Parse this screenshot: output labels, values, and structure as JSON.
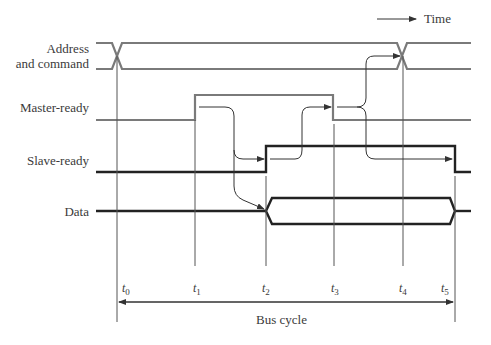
{
  "legend": {
    "label": "Time",
    "icon": "arrow-right"
  },
  "signals": [
    {
      "name": "Address\nand command",
      "line1": "Address",
      "line2": "and command",
      "type": "bus",
      "color": "#7a7a7a"
    },
    {
      "name": "Master-ready",
      "type": "line",
      "color": "#7a7a7a"
    },
    {
      "name": "Slave-ready",
      "type": "line",
      "color": "#222222"
    },
    {
      "name": "Data",
      "type": "bus",
      "color": "#222222"
    }
  ],
  "time_markers": [
    {
      "base": "t",
      "sub": "0"
    },
    {
      "base": "t",
      "sub": "1"
    },
    {
      "base": "t",
      "sub": "2"
    },
    {
      "base": "t",
      "sub": "3"
    },
    {
      "base": "t",
      "sub": "4"
    },
    {
      "base": "t",
      "sub": "5"
    }
  ],
  "span": {
    "label": "Bus cycle",
    "from": "t0",
    "to": "t5"
  },
  "colors": {
    "master_signal": "#7a7a7a",
    "slave_signal": "#222222",
    "arrow": "#333333"
  }
}
